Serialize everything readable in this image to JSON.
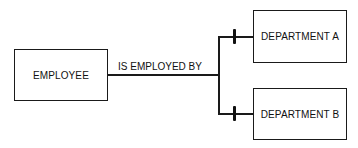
{
  "diagram": {
    "type": "entity-relationship",
    "entities": [
      {
        "id": "employee",
        "label": "EMPLOYEE"
      },
      {
        "id": "department_a",
        "label": "DEPARTMENT A"
      },
      {
        "id": "department_b",
        "label": "DEPARTMENT B"
      }
    ],
    "relationship": {
      "label": "IS EMPLOYED BY",
      "from": "employee",
      "to": [
        "department_a",
        "department_b"
      ],
      "cardinality_marker": "one (single bar)"
    }
  }
}
